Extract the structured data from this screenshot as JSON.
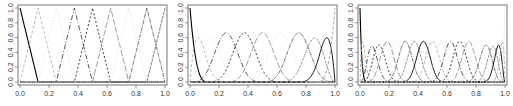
{
  "chart_data": [
    {
      "type": "line",
      "title": "",
      "description": "B-spline basis functions, degree 1 (linear), equally spaced knots",
      "degree": 1,
      "interior_knots": [
        0.125,
        0.25,
        0.375,
        0.5,
        0.625,
        0.75,
        0.875
      ],
      "n_basis": 9,
      "xlim": [
        0,
        1
      ],
      "ylim": [
        0,
        1
      ],
      "xticks": [
        "0.0",
        "0.2",
        "0.4",
        "0.6",
        "0.8",
        "1.0"
      ],
      "yticks": [
        "0.0",
        "0.2",
        "0.4",
        "0.6",
        "0.8",
        "1.0"
      ],
      "peak_x": [
        0,
        0.125,
        0.25,
        0.375,
        0.5,
        0.625,
        0.75,
        0.875,
        1.0
      ],
      "peak_y": [
        1,
        1,
        1,
        1,
        1,
        1,
        1,
        1,
        1
      ],
      "xlabel": "",
      "ylabel": "",
      "grid": false,
      "legend": "none"
    },
    {
      "type": "line",
      "title": "",
      "description": "B-spline basis functions, degree 3 (cubic), equally spaced knots",
      "degree": 3,
      "interior_knots": [
        0.125,
        0.25,
        0.375,
        0.5,
        0.625,
        0.75,
        0.875
      ],
      "n_basis": 11,
      "xlim": [
        0,
        1
      ],
      "ylim": [
        0,
        1
      ],
      "xticks": [
        "0.0",
        "0.2",
        "0.4",
        "0.6",
        "0.8",
        "1.0"
      ],
      "yticks": [
        "0.0",
        "0.2",
        "0.4",
        "0.6",
        "0.8",
        "1.0"
      ],
      "peak_y_approx": [
        1.0,
        0.6,
        0.6,
        0.67,
        0.67,
        0.67,
        0.67,
        0.67,
        0.6,
        0.6,
        1.0
      ],
      "xlabel": "",
      "ylabel": "",
      "grid": false,
      "legend": "none"
    },
    {
      "type": "line",
      "title": "",
      "description": "B-spline basis functions, higher degree, equally spaced knots",
      "degree": 5,
      "interior_knots": [
        0.0625,
        0.125,
        0.1875,
        0.25,
        0.3125,
        0.375,
        0.4375,
        0.5,
        0.5625,
        0.625,
        0.6875,
        0.75,
        0.8125,
        0.875,
        0.9375
      ],
      "n_basis": 21,
      "xlim": [
        0,
        1
      ],
      "ylim": [
        0,
        1
      ],
      "xticks": [
        "0.0",
        "0.2",
        "0.4",
        "0.6",
        "0.8",
        "1.0"
      ],
      "yticks": [
        "0.0",
        "0.2",
        "0.4",
        "0.6",
        "0.8",
        "1.0"
      ],
      "peak_y_approx": [
        1.0,
        0.5,
        0.4,
        0.4,
        0.38,
        0.38,
        0.38,
        0.38,
        0.38,
        0.38,
        0.38,
        0.38,
        0.38,
        0.38,
        0.38,
        0.38,
        0.38,
        0.4,
        0.4,
        0.5,
        1.0
      ],
      "xlabel": "",
      "ylabel": "",
      "grid": false,
      "legend": "none"
    }
  ],
  "styles": {
    "colors": [
      "#000000",
      "#b0b0b0",
      "#d8d8d8",
      "#404040",
      "#222222",
      "#909090",
      "#e4e4e4",
      "#606060",
      "#888888"
    ],
    "dashes": [
      "",
      "3,2",
      "1,2",
      "5,2,1,2",
      "2,2",
      "6,2",
      "1,1",
      "4,1,1,1",
      "3,1"
    ]
  },
  "panels": [
    {
      "left": 0,
      "box": {
        "x": 18,
        "y": 5,
        "w": 149,
        "h": 80
      }
    },
    {
      "left": 171,
      "box": {
        "x": 17,
        "y": 5,
        "w": 149,
        "h": 80
      }
    },
    {
      "left": 342,
      "box": {
        "x": 16,
        "y": 5,
        "w": 149,
        "h": 80
      }
    }
  ]
}
